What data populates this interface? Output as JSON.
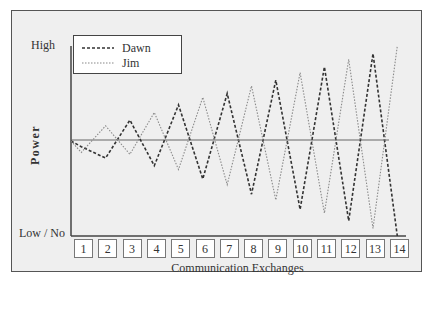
{
  "chart_data": {
    "type": "line",
    "title": "",
    "xlabel": "Communication Exchanges",
    "ylabel": "Power",
    "y_tick_labels": [
      "High",
      "Low / No"
    ],
    "categories": [
      "1",
      "2",
      "3",
      "4",
      "5",
      "6",
      "7",
      "8",
      "9",
      "10",
      "11",
      "12",
      "13",
      "14"
    ],
    "ylim": [
      0,
      100
    ],
    "reference_line": {
      "value": 50,
      "label": "baseline"
    },
    "legend": {
      "position": "top-left",
      "entries": [
        "Dawn",
        "Jim"
      ]
    },
    "series": [
      {
        "name": "Dawn",
        "style": "dashed",
        "color": "#333333",
        "values": [
          47,
          41,
          61,
          37,
          69,
          30,
          75,
          22,
          82,
          14,
          89,
          8,
          96,
          0
        ]
      },
      {
        "name": "Jim",
        "style": "dotted",
        "color": "#888888",
        "values": [
          44,
          58,
          43,
          65,
          35,
          73,
          27,
          79,
          19,
          86,
          12,
          93,
          4,
          100
        ]
      }
    ],
    "start_value": 50,
    "grid": false
  },
  "axis": {
    "high_label": "High",
    "low_label": "Low / No",
    "y_title": "Power",
    "x_title": "Communication Exchanges"
  },
  "legend": {
    "dawn": "Dawn",
    "jim": "Jim"
  },
  "ticks": [
    "1",
    "2",
    "3",
    "4",
    "5",
    "6",
    "7",
    "8",
    "9",
    "10",
    "11",
    "12",
    "13",
    "14"
  ]
}
